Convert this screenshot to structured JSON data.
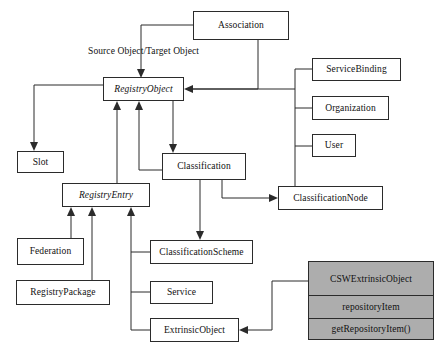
{
  "diagram": {
    "colors": {
      "stroke": "#2b2b2b",
      "background": "#ffffff",
      "highlight_fill": "#adadad"
    },
    "nodes": [
      {
        "id": "association",
        "label": "Association",
        "italic": false,
        "x": 193,
        "y": 11,
        "w": 96,
        "h": 29
      },
      {
        "id": "registryobject",
        "label": "RegistryObject",
        "italic": true,
        "x": 103,
        "y": 77,
        "w": 81,
        "h": 24
      },
      {
        "id": "servicebinding",
        "label": "ServiceBinding",
        "italic": false,
        "x": 312,
        "y": 58,
        "w": 89,
        "h": 23
      },
      {
        "id": "organization",
        "label": "Organization",
        "italic": false,
        "x": 312,
        "y": 96,
        "w": 77,
        "h": 24
      },
      {
        "id": "user",
        "label": "User",
        "italic": false,
        "x": 312,
        "y": 134,
        "w": 44,
        "h": 23
      },
      {
        "id": "slot",
        "label": "Slot",
        "italic": false,
        "x": 17,
        "y": 151,
        "w": 47,
        "h": 22
      },
      {
        "id": "classification",
        "label": "Classification",
        "italic": false,
        "x": 162,
        "y": 153,
        "w": 84,
        "h": 27
      },
      {
        "id": "classificationnode",
        "label": "ClassificationNode",
        "italic": false,
        "x": 278,
        "y": 186,
        "w": 105,
        "h": 24
      },
      {
        "id": "registryentry",
        "label": "RegistryEntry",
        "italic": true,
        "x": 62,
        "y": 183,
        "w": 88,
        "h": 24
      },
      {
        "id": "federation",
        "label": "Federation",
        "italic": false,
        "x": 17,
        "y": 238,
        "w": 67,
        "h": 27
      },
      {
        "id": "classificationscheme",
        "label": "ClassificationScheme",
        "italic": false,
        "x": 150,
        "y": 240,
        "w": 103,
        "h": 24
      },
      {
        "id": "registrypackage",
        "label": "RegistryPackage",
        "italic": false,
        "x": 16,
        "y": 280,
        "w": 94,
        "h": 25
      },
      {
        "id": "service",
        "label": "Service",
        "italic": false,
        "x": 150,
        "y": 281,
        "w": 63,
        "h": 23
      },
      {
        "id": "extrinsicobject",
        "label": "ExtrinsicObject",
        "italic": false,
        "x": 150,
        "y": 318,
        "w": 89,
        "h": 24
      }
    ],
    "highlight_class": {
      "id": "cswextrinsicobject",
      "x": 308,
      "y": 261,
      "w": 126,
      "h": 79,
      "name": "CSWExtrinsicObject",
      "attributes": [
        "repositoryItem"
      ],
      "operations": [
        "getRepositoryItem()"
      ]
    },
    "edge_labels": [
      {
        "id": "source-target-object",
        "text": "Source Object/Target Object",
        "x": 88,
        "y": 46
      }
    ],
    "relationships": [
      {
        "from": "Association",
        "to": "RegistryObject",
        "kind": "generalization"
      },
      {
        "from": "Association",
        "to": "RegistryObject",
        "kind": "association",
        "label": "Source Object/Target Object"
      },
      {
        "from": "ServiceBinding",
        "to": "RegistryObject",
        "kind": "generalization"
      },
      {
        "from": "Organization",
        "to": "RegistryObject",
        "kind": "generalization"
      },
      {
        "from": "User",
        "to": "RegistryObject",
        "kind": "generalization"
      },
      {
        "from": "ClassificationNode",
        "to": "RegistryObject",
        "kind": "generalization"
      },
      {
        "from": "RegistryObject",
        "to": "Slot",
        "kind": "generalization"
      },
      {
        "from": "RegistryObject",
        "to": "Classification",
        "kind": "generalization"
      },
      {
        "from": "Classification",
        "to": "RegistryObject",
        "kind": "association"
      },
      {
        "from": "RegistryEntry",
        "to": "RegistryObject",
        "kind": "generalization"
      },
      {
        "from": "Classification",
        "to": "ClassificationScheme",
        "kind": "association"
      },
      {
        "from": "Classification",
        "to": "ClassificationNode",
        "kind": "association"
      },
      {
        "from": "Federation",
        "to": "RegistryEntry",
        "kind": "generalization"
      },
      {
        "from": "RegistryPackage",
        "to": "RegistryEntry",
        "kind": "generalization"
      },
      {
        "from": "ClassificationScheme",
        "to": "RegistryEntry",
        "kind": "generalization"
      },
      {
        "from": "Service",
        "to": "RegistryEntry",
        "kind": "generalization"
      },
      {
        "from": "ExtrinsicObject",
        "to": "RegistryEntry",
        "kind": "generalization"
      },
      {
        "from": "CSWExtrinsicObject",
        "to": "ExtrinsicObject",
        "kind": "generalization"
      }
    ]
  }
}
